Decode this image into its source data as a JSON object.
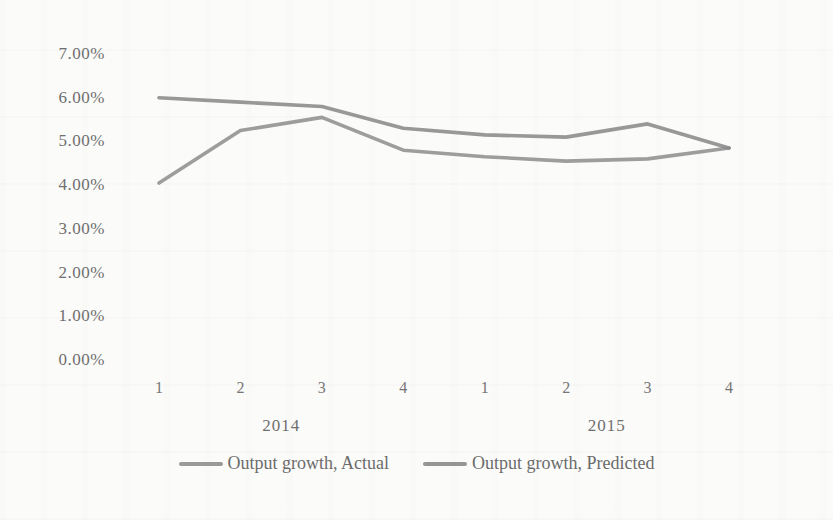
{
  "page": {
    "background_color": "#fbfbf9",
    "text_color": "#6f6f6f"
  },
  "chart_data": {
    "type": "line",
    "title": "",
    "xlabel": "",
    "ylabel": "",
    "grid": false,
    "legend_position": "bottom",
    "x_axis": {
      "quarter_labels": [
        "1",
        "2",
        "3",
        "4",
        "1",
        "2",
        "3",
        "4"
      ],
      "year_groups": [
        {
          "label": "2014",
          "start": 0,
          "end": 3
        },
        {
          "label": "2015",
          "start": 4,
          "end": 7
        }
      ]
    },
    "y_axis": {
      "min": 0,
      "max": 7,
      "step": 1,
      "tick_labels": [
        "0.00%",
        "1.00%",
        "2.00%",
        "3.00%",
        "4.00%",
        "5.00%",
        "6.00%",
        "7.00%"
      ]
    },
    "series": [
      {
        "name": "Output growth, Actual",
        "color": "#8f8f8f",
        "values": [
          4.05,
          5.25,
          5.55,
          4.8,
          4.65,
          4.55,
          4.6,
          4.85
        ]
      },
      {
        "name": "Output growth, Predicted",
        "color": "#8a8a8a",
        "values": [
          6.0,
          5.9,
          5.8,
          5.3,
          5.15,
          5.1,
          5.4,
          4.85
        ]
      }
    ]
  }
}
